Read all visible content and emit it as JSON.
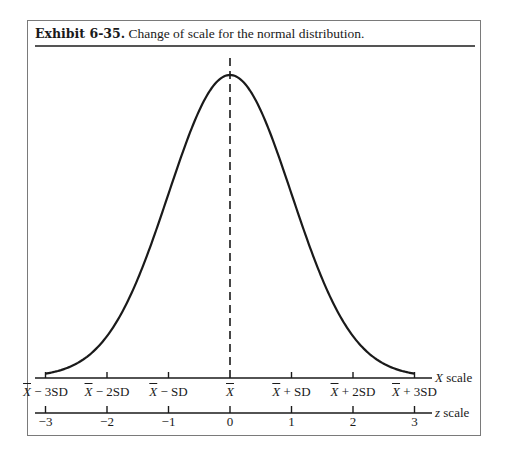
{
  "exhibit": {
    "label": "Exhibit 6-35.",
    "caption": "Change of scale for the normal distribution."
  },
  "chart_data": {
    "type": "line",
    "title": "Exhibit 6-35. Change of scale for the normal distribution.",
    "series": [
      {
        "name": "normal density",
        "x": [
          -3,
          -2.5,
          -2,
          -1.5,
          -1,
          -0.5,
          0,
          0.5,
          1,
          1.5,
          2,
          2.5,
          3
        ],
        "y": [
          0.0044,
          0.0175,
          0.054,
          0.1295,
          0.242,
          0.3521,
          0.3989,
          0.3521,
          0.242,
          0.1295,
          0.054,
          0.0175,
          0.0044
        ]
      }
    ],
    "mean_line": {
      "x": 0,
      "style": "dashed"
    },
    "axes": [
      {
        "name": "X scale",
        "var": "X",
        "tick_labels": [
          "X̄ − 3SD",
          "X̄ − 2SD",
          "X̄ − SD",
          "X̄",
          "X̄ + SD",
          "X̄ + 2SD",
          "X̄ + 3SD"
        ]
      },
      {
        "name": "z scale",
        "var": "z",
        "ticks": [
          -3,
          -2,
          -1,
          0,
          1,
          2,
          3
        ],
        "tick_labels": [
          "−3",
          "−2",
          "−1",
          "0",
          "1",
          "2",
          "3"
        ]
      }
    ],
    "xlim": [
      -3.3,
      3.3
    ],
    "grid": false,
    "legend": "none"
  },
  "xaxis": {
    "name_var": "X",
    "name_suffix": " scale",
    "ticks": [
      {
        "base": "X",
        "suffix": " − 3SD"
      },
      {
        "base": "X",
        "suffix": " − 2SD"
      },
      {
        "base": "X",
        "suffix": " − SD"
      },
      {
        "base": "X",
        "suffix": ""
      },
      {
        "base": "X",
        "suffix": " + SD"
      },
      {
        "base": "X",
        "suffix": " + 2SD"
      },
      {
        "base": "X",
        "suffix": " + 3SD"
      }
    ]
  },
  "zaxis": {
    "name_var": "z",
    "name_suffix": " scale",
    "ticks": [
      "−3",
      "−2",
      "−1",
      "0",
      "1",
      "2",
      "3"
    ]
  }
}
